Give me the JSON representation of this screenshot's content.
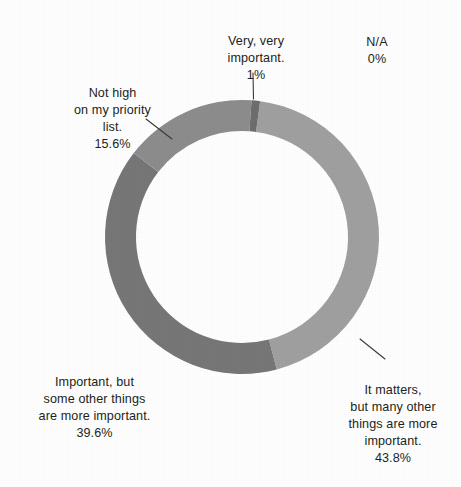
{
  "chart_data": {
    "type": "pie",
    "variant": "donut",
    "title": "",
    "subtitle": "",
    "xlabel": "",
    "ylabel": "",
    "legend_position": "none",
    "grid": false,
    "center": {
      "x": 242,
      "y": 237
    },
    "outer_radius": 137,
    "inner_radius": 106,
    "start_angle_deg": 4,
    "background_color": "#ffffff",
    "label_color": "#231f20",
    "leader_line_color": "#3a3a3a",
    "categories": [
      "Very, very important.",
      "It matters, but many other things are more important.",
      "Important, but some other things are more important.",
      "Not high on my priority list.",
      "N/A"
    ],
    "values": [
      1.0,
      43.8,
      39.6,
      15.6,
      0.0
    ],
    "value_labels": [
      "1%",
      "43.8%",
      "39.6%",
      "15.6%",
      "0%"
    ],
    "colors": [
      "#6e6e6e",
      "#a0a0a0",
      "#777777",
      "#8d8d8d",
      "#bdbdbd"
    ],
    "slices": [
      {
        "name": "very-very-important",
        "label": "Very, very\nimportant.",
        "value_label": "1%",
        "value": 1.0,
        "color": "#6e6e6e",
        "start_deg": 4,
        "end_deg": 7.6,
        "has_leader_line": true
      },
      {
        "name": "it-matters",
        "label": "It matters,\nbut many other\nthings are more\nimportant.",
        "value_label": "43.8%",
        "value": 43.8,
        "color": "#a0a0a0",
        "start_deg": 7.6,
        "end_deg": 165.3,
        "has_leader_line": true
      },
      {
        "name": "important-but-some",
        "label": "Important, but\nsome other things\nare more important.",
        "value_label": "39.6%",
        "value": 39.6,
        "color": "#777777",
        "start_deg": 165.3,
        "end_deg": 307.8,
        "has_leader_line": false
      },
      {
        "name": "not-high-priority",
        "label": "Not high\non my priority\nlist.",
        "value_label": "15.6%",
        "value": 15.6,
        "color": "#8d8d8d",
        "start_deg": 307.8,
        "end_deg": 364.0,
        "has_leader_line": true
      },
      {
        "name": "na",
        "label": "N/A",
        "value_label": "0%",
        "value": 0.0,
        "color": "#bdbdbd",
        "start_deg": 364.0,
        "end_deg": 364.0,
        "has_leader_line": false
      }
    ]
  },
  "labels": {
    "very_very_important": {
      "text": "Very, very\nimportant.",
      "percent": "1%"
    },
    "na": {
      "text": "N/A",
      "percent": "0%"
    },
    "not_high_priority": {
      "text": "Not high\non my priority\nlist.",
      "percent": "15.6%"
    },
    "important_but_some": {
      "text": "Important, but\nsome other things\nare more important.",
      "percent": "39.6%"
    },
    "it_matters": {
      "text": "It matters,\nbut many other\nthings are more\nimportant.",
      "percent": "43.8%"
    }
  }
}
